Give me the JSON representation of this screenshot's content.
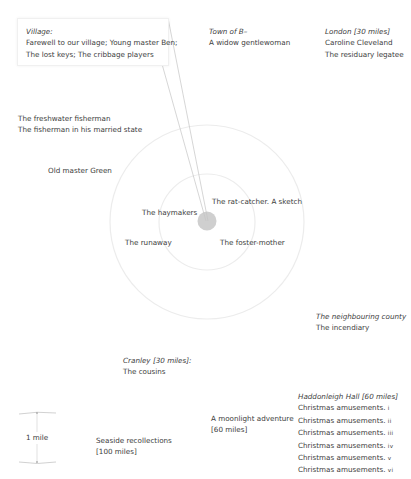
{
  "diagram": {
    "center_marker": "home-circle",
    "rings": [
      "1 mile",
      "2 miles"
    ],
    "scale_bar": {
      "label": "1 mile"
    }
  },
  "callout": {
    "heading": "Village:",
    "lines": [
      "Farewell to our village; Young master Ben;",
      "The lost keys; The cribbage players"
    ]
  },
  "places": {
    "town_b": {
      "heading": "Town of B–",
      "lines": [
        "A widow gentlewoman"
      ]
    },
    "london": {
      "heading": "London [30 miles]",
      "lines": [
        "Caroline Cleveland",
        "The residuary legatee"
      ]
    },
    "fisherman": {
      "lines": [
        "The freshwater fisherman",
        "The fisherman in his married state"
      ]
    },
    "old_master_green": {
      "lines": [
        "Old master Green"
      ]
    },
    "haymakers": {
      "lines": [
        "The haymakers"
      ]
    },
    "rat_catcher": {
      "lines": [
        "The rat-catcher. A sketch"
      ]
    },
    "runaway": {
      "lines": [
        "The runaway"
      ]
    },
    "foster_mother": {
      "lines": [
        "The foster-mother"
      ]
    },
    "neighbouring_county": {
      "heading": "The neighbouring county",
      "lines": [
        "The incendiary"
      ]
    },
    "cranley": {
      "heading": "Cranley [30 miles]:",
      "lines": [
        "The cousins"
      ]
    },
    "seaside": {
      "lines": [
        "Seaside recollections",
        "[100 miles]"
      ]
    },
    "moonlight": {
      "lines": [
        "A moonlight adventure",
        "[60 miles]"
      ]
    },
    "haddonleigh": {
      "heading": "Haddonleigh Hall [60 miles]",
      "items": [
        {
          "text": "Christmas amusements.",
          "numeral": "i"
        },
        {
          "text": "Christmas amusements.",
          "numeral": "ii"
        },
        {
          "text": "Christmas amusements.",
          "numeral": "iii"
        },
        {
          "text": "Christmas amusements.",
          "numeral": "iv"
        },
        {
          "text": "Christmas amusements.",
          "numeral": "v"
        },
        {
          "text": "Christmas amusements.",
          "numeral": "vi"
        }
      ]
    }
  },
  "colors": {
    "ring": "#ececec",
    "center": "#cfcfcf",
    "leader": "#bdbdbd",
    "text": "#3c3c3c"
  }
}
